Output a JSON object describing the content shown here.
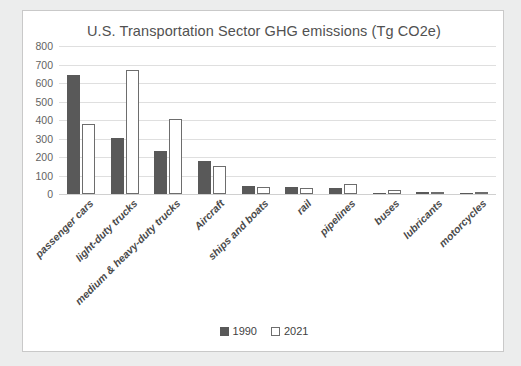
{
  "chart_data": {
    "type": "bar",
    "title": "U.S. Transportation Sector GHG emissions (Tg CO2e)",
    "xlabel": "",
    "ylabel": "",
    "ylim": [
      0,
      800
    ],
    "ytick_step": 100,
    "yticks": [
      "800",
      "700",
      "600",
      "500",
      "400",
      "300",
      "200",
      "100",
      "0"
    ],
    "grid": true,
    "legend_position": "bottom",
    "categories": [
      "passenger cars",
      "light-duty trucks",
      "medium & heavy-duty trucks",
      "Aircraft",
      "ships and boats",
      "rail",
      "pipelines",
      "buses",
      "lubricants",
      "motorcycles"
    ],
    "series": [
      {
        "name": "1990",
        "color": "#595959",
        "values": [
          645,
          305,
          230,
          180,
          45,
          40,
          35,
          8,
          10,
          2
        ]
      },
      {
        "name": "2021",
        "color": "#ffffff",
        "values": [
          380,
          672,
          405,
          150,
          40,
          32,
          55,
          20,
          4,
          4
        ]
      }
    ]
  },
  "colors": {
    "page_background": "#eceded",
    "card_background": "#ffffff",
    "card_border": "#c9c9c9",
    "gridline": "#dfdfdf",
    "title_text": "#515151",
    "tick_text": "#636363",
    "category_text": "#4a4a4a",
    "series_1990": "#595959",
    "series_2021_outline": "#6d6d6d"
  }
}
